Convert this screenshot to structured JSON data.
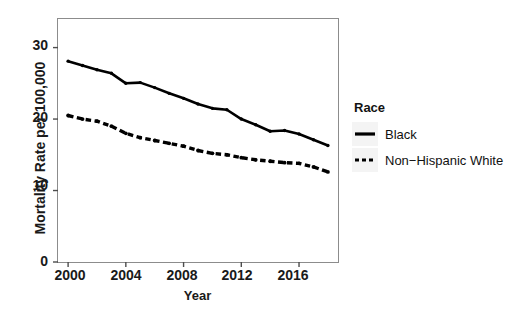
{
  "chart_data": {
    "type": "line",
    "title": "",
    "xlabel": "Year",
    "ylabel": "Mortality Rate per 100,000",
    "xlim": [
      1999.3,
      2018.7
    ],
    "ylim": [
      0,
      34
    ],
    "x_ticks": [
      2000,
      2004,
      2008,
      2012,
      2016
    ],
    "y_ticks": [
      0,
      10,
      20,
      30
    ],
    "grid": false,
    "legend_title": "Race",
    "legend_position": "right",
    "x": [
      2000,
      2001,
      2002,
      2003,
      2004,
      2005,
      2006,
      2007,
      2008,
      2009,
      2010,
      2011,
      2012,
      2013,
      2014,
      2015,
      2016,
      2017,
      2018
    ],
    "series": [
      {
        "name": "Black",
        "style": "solid",
        "color": "#000000",
        "values": [
          28.1,
          27.5,
          26.9,
          26.4,
          25.0,
          25.1,
          24.4,
          23.6,
          22.9,
          22.1,
          21.5,
          21.3,
          20.0,
          19.2,
          18.3,
          18.4,
          17.9,
          17.1,
          16.3
        ]
      },
      {
        "name": "Non−Hispanic White",
        "style": "dashed",
        "color": "#000000",
        "values": [
          20.5,
          20.0,
          19.7,
          19.0,
          18.0,
          17.4,
          17.0,
          16.6,
          16.2,
          15.6,
          15.2,
          15.0,
          14.6,
          14.3,
          14.1,
          13.9,
          13.8,
          13.3,
          12.6
        ]
      }
    ]
  },
  "axes": {
    "y_tick_labels": [
      "30",
      "20",
      "10",
      "0"
    ],
    "x_tick_labels": [
      "2000",
      "2004",
      "2008",
      "2012",
      "2016"
    ],
    "y_title": "Mortality Rate per 100,000",
    "x_title": "Year"
  },
  "legend": {
    "title": "Race",
    "items": [
      {
        "label": "Black",
        "style": "solid"
      },
      {
        "label": "Non−Hispanic White",
        "style": "dashed"
      }
    ]
  },
  "colors": {
    "line": "#000000",
    "panel_border": "#8c8c8c",
    "axis_text": "#1a1a1a",
    "legend_key_bg": "#f4f4f4",
    "background": "#ffffff"
  }
}
